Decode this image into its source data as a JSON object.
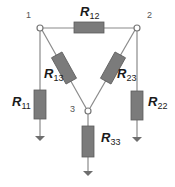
{
  "diagram": {
    "title": "",
    "colors": {
      "wire": "#8a8a8a",
      "resistor_fill": "#7b7b7b",
      "resistor_border": "#5c5c5c",
      "node_fill": "#ffffff",
      "label": "#1a1a1a",
      "node_label": "#555555"
    },
    "nodes": [
      {
        "id": "1",
        "label": "1"
      },
      {
        "id": "2",
        "label": "2"
      },
      {
        "id": "3",
        "label": "3"
      }
    ],
    "resistors": [
      {
        "id": "R12",
        "symbol": "R",
        "subscript": "12",
        "between": [
          "1",
          "2"
        ]
      },
      {
        "id": "R13",
        "symbol": "R",
        "subscript": "13",
        "between": [
          "1",
          "3"
        ]
      },
      {
        "id": "R23",
        "symbol": "R",
        "subscript": "23",
        "between": [
          "2",
          "3"
        ]
      },
      {
        "id": "R11",
        "symbol": "R",
        "subscript": "11",
        "between": [
          "1",
          "ground"
        ]
      },
      {
        "id": "R22",
        "symbol": "R",
        "subscript": "22",
        "between": [
          "2",
          "ground"
        ]
      },
      {
        "id": "R33",
        "symbol": "R",
        "subscript": "33",
        "between": [
          "3",
          "ground"
        ]
      }
    ]
  }
}
